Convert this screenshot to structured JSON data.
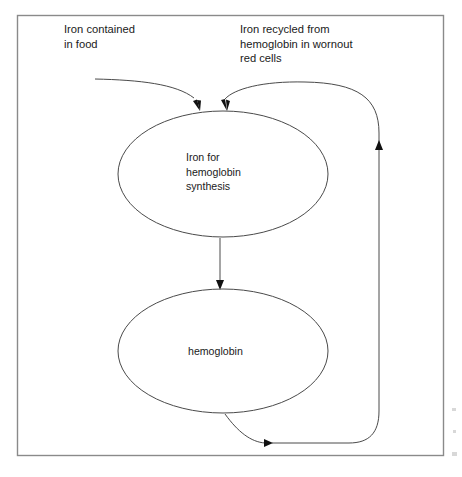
{
  "diagram": {
    "type": "flow-cycle",
    "frame": {
      "name": "outer-border",
      "x": 17,
      "y": 15,
      "width": 426,
      "height": 440,
      "color": "#8a8a8a"
    },
    "colors": {
      "line": "#4a4a4a",
      "text": "#1a1a1a",
      "arrow": "#111111",
      "background": "#ffffff",
      "frame": "#8a8a8a"
    },
    "annotations": [
      {
        "id": "iron-in-food",
        "lines": [
          "Iron contained",
          "in food"
        ],
        "x": 64,
        "y": 33,
        "line_height": 14.5
      },
      {
        "id": "iron-recycled",
        "lines": [
          "Iron recycled from",
          "hemoglobin in wornout",
          "red cells"
        ],
        "x": 240,
        "y": 33,
        "line_height": 14.5
      }
    ],
    "nodes": [
      {
        "id": "iron-for-synthesis",
        "shape": "ellipse",
        "lines": [
          "Iron for",
          "hemoglobin",
          "synthesis"
        ],
        "cx": 223,
        "cy": 174,
        "rx": 105,
        "ry": 63,
        "text_x": 185,
        "text_y": 161,
        "line_height": 14.5
      },
      {
        "id": "hemoglobin",
        "shape": "ellipse",
        "lines": [
          "hemoglobin"
        ],
        "cx": 223,
        "cy": 351,
        "rx": 105,
        "ry": 62,
        "text_x": 187,
        "text_y": 355,
        "line_height": 14.5
      }
    ],
    "edges": [
      {
        "id": "food-to-synthesis",
        "from": "iron-in-food",
        "to": "iron-for-synthesis",
        "path": "M 95 79 C 140 80, 175 83, 193 97",
        "arrow": {
          "x": 200,
          "y": 110,
          "angle": 62
        }
      },
      {
        "id": "recycled-to-synthesis",
        "from": "recycle-loop",
        "to": "iron-for-synthesis",
        "path": "M 379 131 C 379 96, 360 83, 306 82 C 262 82, 233 89, 223 99",
        "arrow": {
          "x": 228,
          "y": 110,
          "angle": 118
        }
      },
      {
        "id": "synthesis-to-hemoglobin",
        "from": "iron-for-synthesis",
        "to": "hemoglobin",
        "path": "M 220 238 L 220 283",
        "arrow": {
          "x": 220,
          "y": 289,
          "angle": 90
        }
      },
      {
        "id": "hemoglobin-to-recycle",
        "from": "hemoglobin",
        "to": "recycle-loop",
        "path": "M 226 415 C 239 433, 252 442, 266 443",
        "arrow": {
          "x": 272,
          "y": 443,
          "angle": 0
        }
      },
      {
        "id": "recycle-riser",
        "from": "bottom-return",
        "to": "top-loop",
        "path": "M 272 443 L 350 443 C 370 443, 379 432, 379 412 L 379 131",
        "arrow": {
          "x": 379,
          "y": 148,
          "angle": -90
        }
      }
    ]
  }
}
